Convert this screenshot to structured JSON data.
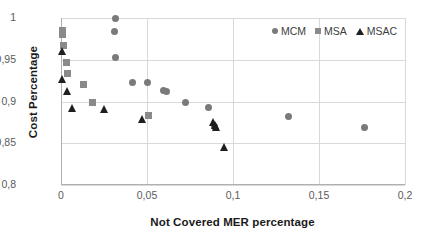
{
  "chart_data": {
    "type": "scatter",
    "title": "",
    "xlabel": "Not Covered MER percentage",
    "ylabel": "Cost Percentage",
    "xlim": [
      0,
      0.2
    ],
    "ylim": [
      0.8,
      1.0
    ],
    "xticks": [
      "0",
      "0,05",
      "0,1",
      "0,15",
      "0,2"
    ],
    "xtick_values": [
      0,
      0.05,
      0.1,
      0.15,
      0.2
    ],
    "yticks": [
      "0,8",
      "0,85",
      "0,9",
      "0,95",
      "1"
    ],
    "ytick_values": [
      0.8,
      0.85,
      0.9,
      0.95,
      1.0
    ],
    "grid": true,
    "legend_position": "top-right",
    "series": [
      {
        "name": "MCM",
        "marker": "circle",
        "color": "#7a7a7a",
        "points": [
          [
            0.0318,
            1.0
          ],
          [
            0.0313,
            0.9835
          ],
          [
            0.0317,
            0.9525
          ],
          [
            0.0415,
            0.9225
          ],
          [
            0.0505,
            0.9225
          ],
          [
            0.0595,
            0.9135
          ],
          [
            0.0615,
            0.9125
          ],
          [
            0.0725,
            0.8985
          ],
          [
            0.0855,
            0.8925
          ],
          [
            0.0895,
            0.87
          ],
          [
            0.1325,
            0.8825
          ],
          [
            0.1765,
            0.8685
          ]
        ]
      },
      {
        "name": "MSA",
        "marker": "square",
        "color": "#8a8a8a",
        "points": [
          [
            0.0008,
            0.9855
          ],
          [
            0.001,
            0.98
          ],
          [
            0.0015,
            0.9665
          ],
          [
            0.003,
            0.9465
          ],
          [
            0.0038,
            0.933
          ],
          [
            0.013,
            0.92
          ],
          [
            0.0185,
            0.899
          ],
          [
            0.051,
            0.8835
          ]
        ]
      },
      {
        "name": "MSAC",
        "marker": "triangle",
        "color": "#1f1f1f",
        "points": [
          [
            0.0008,
            0.96
          ],
          [
            0.0006,
            0.9265
          ],
          [
            0.0035,
            0.912
          ],
          [
            0.0065,
            0.8925
          ],
          [
            0.025,
            0.8905
          ],
          [
            0.0475,
            0.8795
          ],
          [
            0.0885,
            0.876
          ],
          [
            0.09,
            0.872
          ],
          [
            0.0905,
            0.87
          ],
          [
            0.095,
            0.845
          ]
        ]
      }
    ]
  },
  "legend": {
    "items": [
      {
        "label": "MCM",
        "marker": "circle"
      },
      {
        "label": "MSA",
        "marker": "square"
      },
      {
        "label": "MSAC",
        "marker": "triangle"
      }
    ]
  }
}
